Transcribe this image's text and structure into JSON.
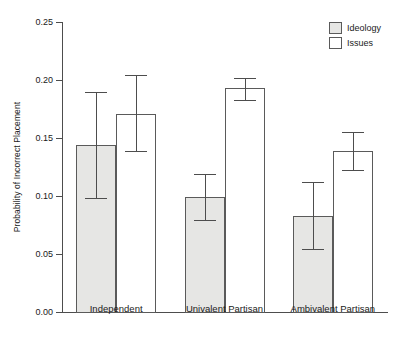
{
  "chart_data": {
    "type": "bar",
    "title": "",
    "xlabel": "",
    "ylabel": "Probability of Incorrect Placement",
    "ylim": [
      0.0,
      0.25
    ],
    "yticks": [
      0.0,
      0.05,
      0.1,
      0.15,
      0.2,
      0.25
    ],
    "ytick_labels": [
      "0.00",
      "0.05",
      "0.10",
      "0.15",
      "0.20",
      "0.25"
    ],
    "grid": false,
    "legend_position": "top-right",
    "categories": [
      "Independent",
      "Univalent Partisan",
      "Ambivalent Partisan"
    ],
    "series": [
      {
        "name": "Ideology",
        "color": "#e6e6e4",
        "values": [
          0.144,
          0.099,
          0.083
        ],
        "ci_low": [
          0.098,
          0.079,
          0.054
        ],
        "ci_high": [
          0.19,
          0.119,
          0.112
        ]
      },
      {
        "name": "Issues",
        "color": "#ffffff",
        "values": [
          0.171,
          0.193,
          0.139
        ],
        "ci_low": [
          0.139,
          0.183,
          0.122
        ],
        "ci_high": [
          0.204,
          0.202,
          0.155
        ]
      }
    ]
  },
  "legend": {
    "items": [
      {
        "label": "Ideology",
        "swatch": "ideology-swatch"
      },
      {
        "label": "Issues",
        "swatch": "issues-swatch"
      }
    ]
  },
  "colors": {
    "bar_fill_ideology": "#e6e6e4",
    "bar_fill_issues": "#ffffff",
    "bar_stroke": "#5a5a5a",
    "axis": "#4d4d4d",
    "text": "#1a1a1a",
    "background": "#ffffff"
  }
}
